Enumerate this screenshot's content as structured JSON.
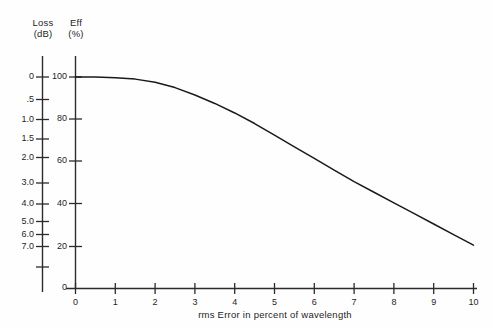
{
  "chart_data": {
    "type": "line",
    "title": "",
    "xlabel": "rms Error in percent of wavelength",
    "ylabel_left": "Loss (dB)",
    "ylabel_right": "Eff (%)",
    "xlim": [
      0,
      10
    ],
    "grid": false,
    "legend": "none",
    "x": [
      0,
      0.5,
      1,
      1.5,
      2,
      2.5,
      3,
      3.5,
      4,
      4.5,
      5,
      5.5,
      6,
      6.5,
      7,
      7.5,
      8,
      8.5,
      9,
      9.5,
      10
    ],
    "series": [
      {
        "name": "Aperture efficiency vs rms error",
        "unit": "%",
        "values": [
          100,
          100,
          99.6,
          99,
          97.5,
          95,
          91.5,
          87.5,
          83,
          78,
          72.5,
          67,
          61.5,
          56,
          50.5,
          45.5,
          40.5,
          35.5,
          30.5,
          25.5,
          20.5
        ]
      }
    ],
    "left_axis": {
      "label_line1": "Loss",
      "label_line2": "(dB)",
      "ticks": [
        {
          "value": 0,
          "label": "0"
        },
        {
          "value": 0.5,
          "label": ".5"
        },
        {
          "value": 1.0,
          "label": "1.0"
        },
        {
          "value": 1.5,
          "label": "1.5"
        },
        {
          "value": 2.0,
          "label": "2.0"
        },
        {
          "value": 3.0,
          "label": "3.0"
        },
        {
          "value": 4.0,
          "label": "4.0"
        },
        {
          "value": 5.0,
          "label": "5.0"
        },
        {
          "value": 6.0,
          "label": "6.0"
        },
        {
          "value": 7.0,
          "label": "7.0"
        },
        {
          "value": 10.0,
          "label": ""
        }
      ]
    },
    "right_axis": {
      "label_line1": "Eff",
      "label_line2": "(%)",
      "ticks": [
        {
          "value": 100,
          "label": "100"
        },
        {
          "value": 80,
          "label": "80"
        },
        {
          "value": 60,
          "label": "60"
        },
        {
          "value": 40,
          "label": "40"
        },
        {
          "value": 20,
          "label": "20"
        },
        {
          "value": 0,
          "label": "0"
        }
      ]
    },
    "x_axis": {
      "ticks": [
        {
          "value": 0,
          "label": "0"
        },
        {
          "value": 1,
          "label": "1"
        },
        {
          "value": 2,
          "label": "2"
        },
        {
          "value": 3,
          "label": "3"
        },
        {
          "value": 4,
          "label": "4"
        },
        {
          "value": 5,
          "label": "5"
        },
        {
          "value": 6,
          "label": "6"
        },
        {
          "value": 7,
          "label": "7"
        },
        {
          "value": 8,
          "label": "8"
        },
        {
          "value": 9,
          "label": "9"
        },
        {
          "value": 10,
          "label": "10"
        }
      ]
    },
    "colors": {
      "curve": "#1a1a1a",
      "axis": "#2b2b2b",
      "background": "#fefefe"
    }
  }
}
